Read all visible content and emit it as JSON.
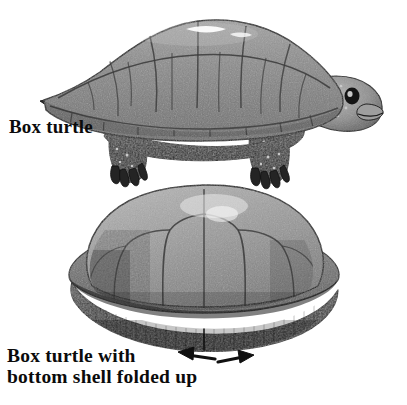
{
  "figure": {
    "background_color": "#ffffff",
    "ink_color": "#0b0b0b",
    "width": 407,
    "height": 405
  },
  "labels": {
    "top": {
      "text": "Box turtle",
      "lines": [
        "Box turtle"
      ]
    },
    "bottom": {
      "text": "Box turtle with bottom shell folded up",
      "lines": [
        "Box turtle with",
        "bottom shell folded up"
      ]
    }
  },
  "illustrations": [
    {
      "name": "box-turtle-open",
      "view": "side profile facing right",
      "parts": [
        "carapace",
        "head",
        "neck",
        "tail",
        "front leg",
        "hind leg",
        "plastron rim"
      ],
      "shading": "grayscale pen-and-ink with stipple texture"
    },
    {
      "name": "box-turtle-closed",
      "view": "front view, shell closed",
      "parts": [
        "domed carapace",
        "marginal scutes",
        "folded plastron",
        "hinge seam"
      ],
      "shading": "grayscale pen-and-ink with stipple texture"
    }
  ],
  "annotations": {
    "arrows": [
      {
        "name": "arrow-left",
        "direction": "left",
        "meaning": "shell folds outward left"
      },
      {
        "name": "arrow-right",
        "direction": "right",
        "meaning": "shell folds outward right"
      }
    ]
  },
  "colors": {
    "shell_mid": "#8d8d8d",
    "shell_dark": "#4b4b4b",
    "shell_light": "#c4c4c4",
    "limb_dark": "#262626",
    "outline": "#1a1a1a",
    "highlight": "#f2f2f2",
    "plastron_dark": "#3a3a3a"
  }
}
